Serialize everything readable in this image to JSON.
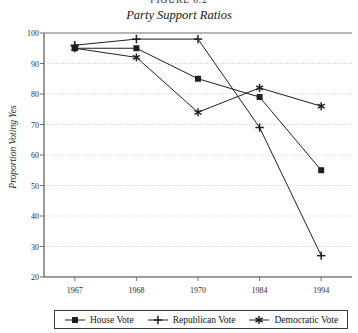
{
  "figure": {
    "number": "Figure 6.2",
    "title": "Party Support Ratios"
  },
  "chart_data": {
    "type": "line",
    "title": "Party Support Ratios",
    "xlabel": "",
    "ylabel": "Proportion Voting Yes",
    "categories": [
      "1967",
      "1968",
      "1970",
      "1984",
      "1994"
    ],
    "ylim": [
      20,
      100
    ],
    "yticks": [
      20,
      30,
      40,
      50,
      60,
      70,
      80,
      90,
      100
    ],
    "grid": "horizontal-dotted",
    "legend_position": "bottom",
    "series": [
      {
        "name": "House Vote",
        "marker": "square",
        "values": [
          95,
          95,
          85,
          79,
          55
        ]
      },
      {
        "name": "Republican Vote",
        "marker": "plus",
        "values": [
          96,
          98,
          98,
          69,
          27
        ]
      },
      {
        "name": "Democratic Vote",
        "marker": "asterisk",
        "values": [
          95,
          92,
          74,
          82,
          76
        ]
      }
    ]
  },
  "legend": {
    "items": [
      {
        "label": "House Vote",
        "marker": "square-marker-icon"
      },
      {
        "label": "Republican Vote",
        "marker": "plus-marker-icon"
      },
      {
        "label": "Democratic Vote",
        "marker": "asterisk-marker-icon"
      }
    ]
  },
  "colors": {
    "line": "#1f1f1f",
    "grid": "#b9b9b9",
    "axis": "#6f6f6f",
    "text": "#1a1a1a"
  }
}
